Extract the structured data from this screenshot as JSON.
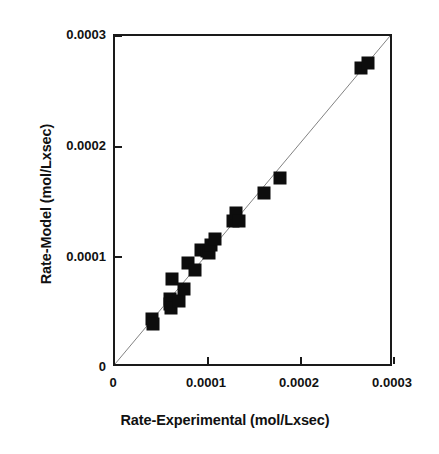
{
  "chart_data": {
    "type": "scatter",
    "title": "",
    "xlabel": "Rate-Experimental (mol/Lxsec)",
    "ylabel": "Rate-Model (mol/Lxsec)",
    "xlim": [
      0,
      0.0003
    ],
    "ylim": [
      0,
      0.0003
    ],
    "xticks": [
      0,
      0.0001,
      0.0002,
      0.0003
    ],
    "yticks": [
      0,
      0.0001,
      0.0002,
      0.0003
    ],
    "xtick_labels": [
      "0",
      "0.0001",
      "0.0002",
      "0.0003"
    ],
    "ytick_labels": [
      "0",
      "0.0001",
      "0.0002",
      "0.0003"
    ],
    "grid": false,
    "legend": null,
    "reference_line": {
      "name": "parity-line",
      "type": "line",
      "x": [
        0,
        0.0003
      ],
      "y": [
        0,
        0.0003
      ],
      "color": "#808080",
      "width": 1
    },
    "series": [
      {
        "name": "Rate model vs experimental",
        "marker": "filled-square",
        "color": "#0d0d0d",
        "points": [
          {
            "x": 3.95e-05,
            "y": 4.4e-05
          },
          {
            "x": 4.05e-05,
            "y": 3.95e-05
          },
          {
            "x": 5.9e-05,
            "y": 6.2e-05
          },
          {
            "x": 5.95e-05,
            "y": 5.75e-05
          },
          {
            "x": 6.05e-05,
            "y": 5.45e-05
          },
          {
            "x": 6.1e-05,
            "y": 8.05e-05
          },
          {
            "x": 6.85e-05,
            "y": 6.05e-05
          },
          {
            "x": 7.4e-05,
            "y": 7.15e-05
          },
          {
            "x": 7.9e-05,
            "y": 9.45e-05
          },
          {
            "x": 8.55e-05,
            "y": 8.85e-05
          },
          {
            "x": 9.3e-05,
            "y": 0.0001065
          },
          {
            "x": 9.85e-05,
            "y": 0.000106
          },
          {
            "x": 0.000101,
            "y": 0.000104
          },
          {
            "x": 0.0001035,
            "y": 0.000111
          },
          {
            "x": 0.000108,
            "y": 0.0001165
          },
          {
            "x": 0.0001265,
            "y": 0.000133
          },
          {
            "x": 0.00013,
            "y": 0.0001405
          },
          {
            "x": 0.000133,
            "y": 0.0001325
          },
          {
            "x": 0.0001605,
            "y": 0.000158
          },
          {
            "x": 0.0001775,
            "y": 0.000172
          },
          {
            "x": 0.0002645,
            "y": 0.0002715
          },
          {
            "x": 0.000272,
            "y": 0.000276
          }
        ]
      }
    ]
  }
}
